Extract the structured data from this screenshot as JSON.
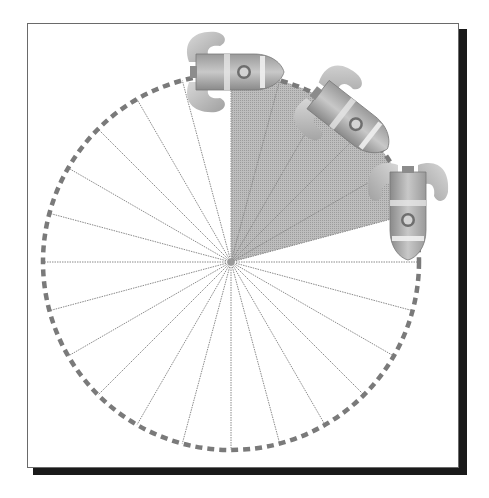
{
  "diagram": {
    "center": [
      231,
      262
    ],
    "radius": 188,
    "spoke_count": 24,
    "spoke_step_degrees": 15,
    "shaded_wedge": {
      "start_degrees": 0,
      "end_degrees": 75,
      "fill": "#b4b4b4"
    },
    "rim": {
      "style": "dashed",
      "color": "#7a7a7a"
    },
    "spoke_color": "#8a8a8a",
    "frame": {
      "border_color": "#6a6a6a",
      "shadow_color": "#1a1a1a"
    },
    "rockets": [
      {
        "name": "rocket-1",
        "angle_degrees": 0,
        "heading": "right"
      },
      {
        "name": "rocket-2",
        "angle_degrees": 45,
        "heading": "down-right"
      },
      {
        "name": "rocket-3",
        "angle_degrees": 90,
        "heading": "down"
      }
    ]
  }
}
